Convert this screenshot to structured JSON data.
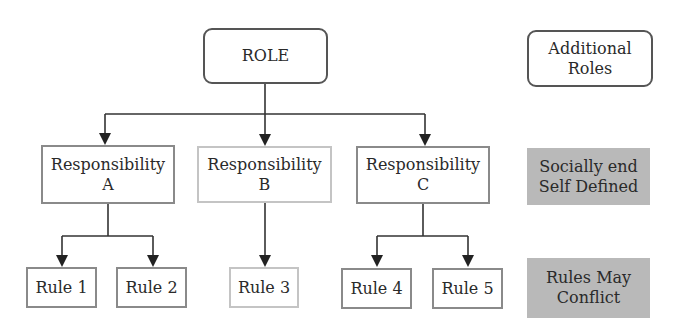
{
  "diagram": {
    "type": "hierarchy",
    "root": {
      "label": "ROLE"
    },
    "side_notes": [
      {
        "label_line1": "Additional",
        "label_line2": "Roles",
        "style": "rounded"
      },
      {
        "label_line1": "Socially end",
        "label_line2": "Self Defined",
        "style": "shaded"
      },
      {
        "label_line1": "Rules May",
        "label_line2": "Conflict",
        "style": "shaded"
      }
    ],
    "responsibilities": [
      {
        "label_line1": "Responsibility",
        "label_line2": "A"
      },
      {
        "label_line1": "Responsibility",
        "label_line2": "B"
      },
      {
        "label_line1": "Responsibility",
        "label_line2": "C"
      }
    ],
    "rules": [
      {
        "label": "Rule 1",
        "parent": "A"
      },
      {
        "label": "Rule 2",
        "parent": "A"
      },
      {
        "label": "Rule 3",
        "parent": "B"
      },
      {
        "label": "Rule 4",
        "parent": "C"
      },
      {
        "label": "Rule 5",
        "parent": "C"
      }
    ],
    "edges": [
      [
        "ROLE",
        "Responsibility A"
      ],
      [
        "ROLE",
        "Responsibility B"
      ],
      [
        "ROLE",
        "Responsibility C"
      ],
      [
        "Responsibility A",
        "Rule 1"
      ],
      [
        "Responsibility A",
        "Rule 2"
      ],
      [
        "Responsibility B",
        "Rule 3"
      ],
      [
        "Responsibility C",
        "Rule 4"
      ],
      [
        "Responsibility C",
        "Rule 5"
      ]
    ],
    "colors": {
      "stroke": "#333333",
      "shaded_fill": "#b9b9b9",
      "background": "#ffffff"
    }
  }
}
